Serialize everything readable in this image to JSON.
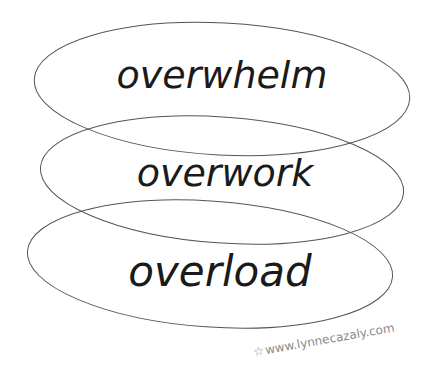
{
  "diagram": {
    "layers": [
      {
        "label": "overwhelm",
        "cx": 222,
        "cy": 89,
        "rx": 188,
        "ry": 66,
        "rotate": 3
      },
      {
        "label": "overwork",
        "cx": 222,
        "cy": 180,
        "rx": 182,
        "ry": 63,
        "rotate": 4
      },
      {
        "label": "overload",
        "cx": 210,
        "cy": 264,
        "rx": 183,
        "ry": 63,
        "rotate": 4
      }
    ],
    "credit": "www.lynnecazaly.com",
    "credit_icon": "star-icon",
    "colors": {
      "stroke": "#555555",
      "text": "#1a1a1a",
      "credit": "#8a8a8a",
      "background": "#ffffff"
    }
  }
}
